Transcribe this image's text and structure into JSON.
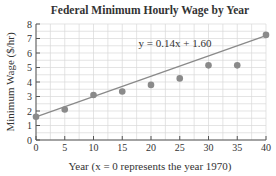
{
  "chart_data": {
    "type": "scatter",
    "title": "Federal Minimum Hourly Wage by Year",
    "xlabel": "Year (x = 0 represents the year 1970)",
    "ylabel": "Minimum Wage ($/hr)",
    "x": [
      0,
      5,
      10,
      15,
      20,
      25,
      30,
      35,
      40
    ],
    "y": [
      1.6,
      2.1,
      3.1,
      3.35,
      3.8,
      4.25,
      5.15,
      5.15,
      7.25
    ],
    "xlim": [
      0,
      40
    ],
    "ylim": [
      0,
      8
    ],
    "xticks": [
      0,
      5,
      10,
      15,
      20,
      25,
      30,
      35,
      40
    ],
    "yticks": [
      0,
      1,
      2,
      3,
      4,
      5,
      6,
      7,
      8
    ],
    "grid": true,
    "trendline": {
      "slope": 0.14,
      "intercept": 1.6,
      "label": "y = 0.14x + 1.60"
    },
    "colors": {
      "points": "#8a8a8a",
      "line": "#8a8a8a",
      "grid": "#d8d8d8",
      "axis": "#555555"
    }
  }
}
